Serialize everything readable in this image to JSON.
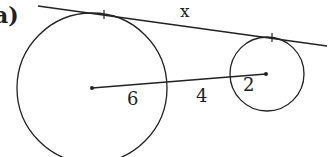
{
  "part_label": "a)",
  "diagram": {
    "large_circle": {
      "radius_label": "6",
      "center": [
        92,
        88
      ],
      "r": 75
    },
    "small_circle": {
      "radius_label": "2",
      "center": [
        267,
        74
      ],
      "r": 37
    },
    "gap_label": "4",
    "tangent_label": "x",
    "colors": {
      "stroke": "#222222",
      "background": "#ffffff"
    }
  }
}
